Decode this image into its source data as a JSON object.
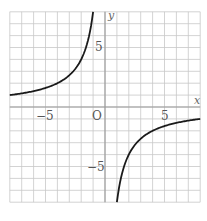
{
  "chart_data": {
    "type": "line",
    "title": "",
    "function": "y = -8/x",
    "xlabel": "x",
    "ylabel": "y",
    "origin_label": "O",
    "xlim": [
      -8,
      8
    ],
    "ylim": [
      -8,
      8
    ],
    "grid": true,
    "grid_step": 1,
    "x_tick_labels": [
      {
        "value": -5,
        "text": "−5"
      },
      {
        "value": 5,
        "text": "5"
      }
    ],
    "y_tick_labels": [
      {
        "value": 5,
        "text": "5"
      },
      {
        "value": -5,
        "text": "−5"
      }
    ],
    "series": [
      {
        "name": "left-branch",
        "x": [
          -8,
          -6,
          -4,
          -3,
          -2,
          -1.5,
          -1.2,
          -1
        ],
        "y": [
          1,
          1.33,
          2,
          2.67,
          4,
          5.33,
          6.67,
          8
        ]
      },
      {
        "name": "right-branch",
        "x": [
          1,
          1.2,
          1.5,
          2,
          3,
          4,
          6,
          8
        ],
        "y": [
          -8,
          -6.67,
          -5.33,
          -4,
          -2.67,
          -2,
          -1.33,
          -1
        ]
      }
    ],
    "colors": {
      "curve": "#1a1a1a",
      "grid": "#c8c8c8",
      "axis": "#999999"
    }
  }
}
